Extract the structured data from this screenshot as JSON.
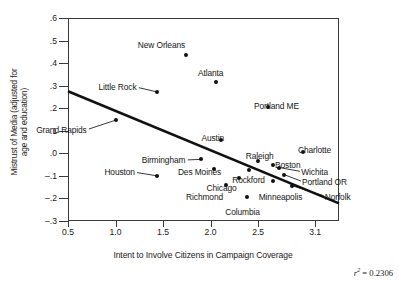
{
  "chart_data": {
    "type": "scatter",
    "title": "",
    "xlabel": "Intent to Involve Citizens in Campaign Coverage",
    "ylabel": "Mistrust of Media (adjusted for\nage and education)",
    "xlim": [
      0.5,
      3.35
    ],
    "ylim": [
      -0.3,
      0.6
    ],
    "xticks": [
      "0.5",
      "1.0",
      "1.5",
      "2.0",
      "2.5",
      "3.1"
    ],
    "xtick_values": [
      0.5,
      1.0,
      1.5,
      2.0,
      2.5,
      3.1
    ],
    "yticks": [
      ".6",
      ".5",
      ".4",
      ".3",
      ".2",
      ".1",
      ".0",
      "–.1",
      "–.2",
      "–.3"
    ],
    "ytick_values": [
      0.6,
      0.5,
      0.4,
      0.3,
      0.2,
      0.1,
      0.0,
      -0.1,
      -0.2,
      -0.3
    ],
    "grid": false,
    "legend": "none",
    "annotation": "r2 = 0.2306",
    "r_squared_label": "r",
    "r_squared_exp": "2",
    "r_squared_value": "= 0.2306",
    "fit_line": {
      "type": "linear-regression",
      "x_start": 0.5,
      "y_start": 0.275,
      "x_end": 3.35,
      "y_end": -0.222
    },
    "points": [
      {
        "label": "New Orleans",
        "x": 1.74,
        "y": 0.437,
        "lx": 162,
        "ly": 45,
        "anchor": "center"
      },
      {
        "label": "Atlanta",
        "x": 2.06,
        "y": 0.318,
        "lx": 211,
        "ly": 73,
        "anchor": "center"
      },
      {
        "label": "Little Rock",
        "x": 1.44,
        "y": 0.272,
        "lx": 118,
        "ly": 87,
        "anchor": "center"
      },
      {
        "label": "Portland ME",
        "x": 2.6,
        "y": 0.205,
        "lx": 277,
        "ly": 106,
        "anchor": "center"
      },
      {
        "label": "Grand Rapids",
        "x": 1.0,
        "y": 0.147,
        "lx": 62,
        "ly": 130,
        "anchor": "center"
      },
      {
        "label": "Austin",
        "x": 2.11,
        "y": 0.06,
        "lx": 213,
        "ly": 138,
        "anchor": "center"
      },
      {
        "label": "Charlotte",
        "x": 2.97,
        "y": 0.004,
        "lx": 315,
        "ly": 150,
        "anchor": "center"
      },
      {
        "label": "Raleigh",
        "x": 2.5,
        "y": -0.033,
        "lx": 260,
        "ly": 156,
        "anchor": "center"
      },
      {
        "label": "Birmingham",
        "x": 1.9,
        "y": -0.027,
        "lx": 164,
        "ly": 160,
        "anchor": "center"
      },
      {
        "label": "Boston",
        "x": 2.66,
        "y": -0.053,
        "lx": 288,
        "ly": 165,
        "anchor": "center"
      },
      {
        "label": "Wichita",
        "x": 2.72,
        "y": -0.063,
        "lx": 315,
        "ly": 172,
        "anchor": "center"
      },
      {
        "label": "Des Moines",
        "x": 2.04,
        "y": -0.068,
        "lx": 200,
        "ly": 172,
        "anchor": "center"
      },
      {
        "label": "Houston",
        "x": 1.44,
        "y": -0.1,
        "lx": 120,
        "ly": 172,
        "anchor": "center"
      },
      {
        "label": "Rockford",
        "x": 2.4,
        "y": -0.072,
        "lx": 249,
        "ly": 180,
        "anchor": "center"
      },
      {
        "label": "Portland OR",
        "x": 2.77,
        "y": -0.094,
        "lx": 325,
        "ly": 182,
        "anchor": "center"
      },
      {
        "label": "Chicago",
        "x": 2.3,
        "y": -0.108,
        "lx": 222,
        "ly": 188,
        "anchor": "center"
      },
      {
        "label": "Minneapolis",
        "x": 2.66,
        "y": -0.122,
        "lx": 281,
        "ly": 197,
        "anchor": "center"
      },
      {
        "label": "Norfolk",
        "x": 2.86,
        "y": -0.144,
        "lx": 338,
        "ly": 197,
        "anchor": "center"
      },
      {
        "label": "Richmond",
        "x": 2.16,
        "y": -0.14,
        "lx": 205,
        "ly": 197,
        "anchor": "center"
      },
      {
        "label": "Columbia",
        "x": 2.38,
        "y": -0.192,
        "lx": 243,
        "ly": 212,
        "anchor": "center"
      }
    ]
  }
}
